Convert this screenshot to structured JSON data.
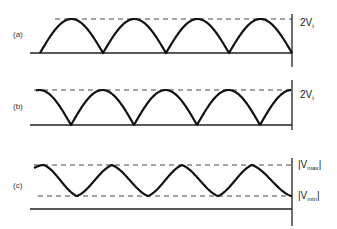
{
  "figure": {
    "panels": [
      {
        "id": "a",
        "label": "(a)",
        "description": "Full-wave rectified waveform (sine halves starting at zero)",
        "waveform": "rectified-sine-start-zero",
        "half_cycles": 4,
        "reference_labels": [
          {
            "main": "2V",
            "sub": "t"
          }
        ]
      },
      {
        "id": "b",
        "label": "(b)",
        "description": "Full-wave rectified waveform shifted (starting at peak)",
        "waveform": "rectified-cosine-start-peak",
        "half_cycles": 4,
        "reference_labels": [
          {
            "main": "2V",
            "sub": "t"
          }
        ]
      },
      {
        "id": "c",
        "label": "(c)",
        "description": "Smoothed ripple waveform between Vmax and Vmin",
        "waveform": "ripple",
        "cycles": 4,
        "reference_labels": [
          {
            "main": "|V",
            "sub": "max",
            "suffix": "|"
          },
          {
            "main": "|V",
            "sub": "min",
            "suffix": "|"
          }
        ]
      }
    ]
  }
}
